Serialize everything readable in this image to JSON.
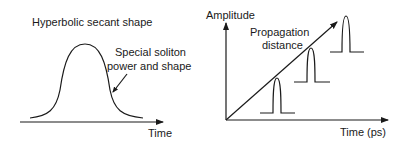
{
  "left_panel": {
    "title": "Hyperbolic secant shape",
    "annotation_line1": "Special soliton",
    "annotation_line2": "power and shape",
    "x_axis_label": "Time"
  },
  "right_panel": {
    "y_axis_label": "Amplitude",
    "diagonal_label_line1": "Propagation",
    "diagonal_label_line2": "distance",
    "x_axis_label": "Time (ps)",
    "pulse_count": 3
  }
}
